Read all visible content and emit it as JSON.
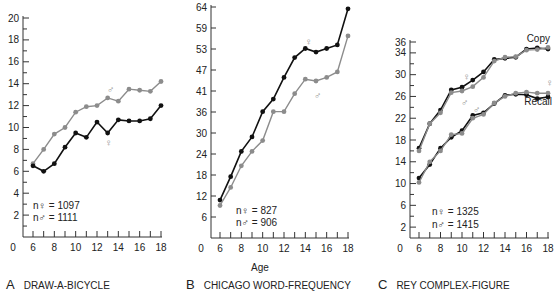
{
  "figure": {
    "shared_xlabel": "Age",
    "panels": [
      {
        "letter": "A",
        "title": "DRAW-A-BICYCLE"
      },
      {
        "letter": "B",
        "title": "CHICAGO WORD-FREQUENCY"
      },
      {
        "letter": "C",
        "title": "REY COMPLEX-FIGURE"
      }
    ]
  },
  "colors": {
    "female": "#111111",
    "male": "#8c8c8c",
    "axis": "#333333"
  },
  "chart_data": [
    {
      "type": "line",
      "title": "DRAW-A-BICYCLE",
      "panel": "A",
      "xlabel": "",
      "ylabel": "",
      "x": [
        6,
        7,
        8,
        9,
        10,
        11,
        12,
        13,
        14,
        15,
        16,
        17,
        18
      ],
      "xticks": [
        0,
        6,
        8,
        10,
        12,
        14,
        16,
        18
      ],
      "yticks": [
        2,
        4,
        6,
        8,
        10,
        12,
        14,
        16,
        18,
        20
      ],
      "ylim": [
        0,
        20
      ],
      "xlim": [
        5,
        18
      ],
      "grid": false,
      "annotations": {
        "n_female": "n♀ = 1097",
        "n_male": "n♂ = 1111",
        "female_symbol": "♀",
        "male_symbol": "♂"
      },
      "series": [
        {
          "name": "♂ (male)",
          "values": [
            6.7,
            8.0,
            9.4,
            10.0,
            11.4,
            11.9,
            12.0,
            12.7,
            12.4,
            13.5,
            13.4,
            13.3,
            14.2
          ]
        },
        {
          "name": "♀ (female)",
          "values": [
            6.5,
            6.0,
            6.7,
            8.2,
            9.5,
            9.1,
            10.5,
            9.5,
            10.7,
            10.6,
            10.6,
            10.8,
            12.0
          ]
        }
      ]
    },
    {
      "type": "line",
      "title": "CHICAGO WORD-FREQUENCY",
      "panel": "B",
      "xlabel": "Age",
      "ylabel": "",
      "x": [
        6,
        7,
        8,
        9,
        10,
        11,
        12,
        13,
        14,
        15,
        16,
        17,
        18
      ],
      "xticks": [
        0,
        6,
        8,
        10,
        12,
        14,
        16,
        18
      ],
      "yticks": [
        6,
        12,
        18,
        24,
        30,
        36,
        41,
        47,
        53,
        59,
        64
      ],
      "ylim": [
        0,
        64
      ],
      "xlim": [
        5,
        18
      ],
      "grid": false,
      "annotations": {
        "n_female": "n♀ = 827",
        "n_male": "n♂ = 906",
        "female_symbol": "♀",
        "male_symbol": "♂"
      },
      "series": [
        {
          "name": "♀ (female)",
          "values": [
            10.5,
            17,
            24,
            28,
            35,
            38.5,
            44.5,
            50,
            52.5,
            51.5,
            52.5,
            53.5,
            63.5
          ]
        },
        {
          "name": "♂ (male)",
          "values": [
            9,
            14,
            20,
            24,
            27,
            35,
            35,
            40,
            44,
            43.5,
            44.5,
            46,
            56
          ]
        }
      ]
    },
    {
      "type": "line",
      "title": "REY COMPLEX-FIGURE",
      "panel": "C",
      "xlabel": "",
      "ylabel": "",
      "x": [
        6,
        7,
        8,
        9,
        10,
        11,
        12,
        13,
        14,
        15,
        16,
        17,
        18
      ],
      "xticks": [
        0,
        6,
        8,
        10,
        12,
        14,
        16,
        18
      ],
      "yticks": [
        2,
        6,
        10,
        14,
        18,
        22,
        26,
        30,
        34,
        36
      ],
      "ylim": [
        0,
        36
      ],
      "xlim": [
        5,
        18
      ],
      "grid": false,
      "annotations": {
        "n_female": "n♀ = 1325",
        "n_male": "n♂ = 1415",
        "copy_label": "Copy",
        "recall_label": "Recall",
        "female_symbol": "♀",
        "male_symbol": "♂"
      },
      "series": [
        {
          "name": "Copy ♀ (female)",
          "values": [
            16.5,
            21,
            23.5,
            27.2,
            27.7,
            29,
            30.5,
            32.8,
            33,
            33.2,
            34.7,
            34.9,
            34.7
          ]
        },
        {
          "name": "Copy ♂ (male)",
          "values": [
            16,
            21,
            23,
            26.7,
            27,
            27.8,
            29.5,
            32.5,
            33.2,
            33.3,
            34.5,
            34.6,
            35
          ]
        },
        {
          "name": "Recall ♀ (female)",
          "values": [
            11,
            13.5,
            16.5,
            18.5,
            19.7,
            22.5,
            23,
            24.7,
            26.2,
            26.4,
            26.3,
            25.6,
            25.9
          ]
        },
        {
          "name": "Recall ♂ (male)",
          "values": [
            10.2,
            14,
            16,
            19,
            19.2,
            22,
            22.7,
            24.8,
            26,
            26.6,
            26.8,
            26.6,
            26.6
          ]
        }
      ]
    }
  ]
}
